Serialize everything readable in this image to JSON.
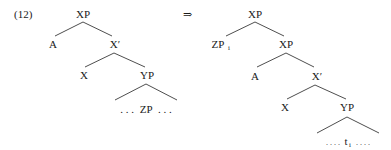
{
  "example_number": "(12)",
  "arrow": "⇒",
  "left_tree": {
    "root": "XP",
    "spec": "A",
    "xbar": "X′",
    "head": "X",
    "complement": "YP",
    "contents": "ZP",
    "ellipsis_left": ". . .",
    "ellipsis_right": ". . .",
    "contents_full": ". . . ZP . . ."
  },
  "right_tree": {
    "root": "XP",
    "moved": "ZP",
    "moved_index": "i",
    "inner_xp": "XP",
    "spec": "A",
    "xbar": "X′",
    "head": "X",
    "complement": "YP",
    "trace": "t",
    "trace_index": "i",
    "ellipsis_left": ". . . .",
    "ellipsis_right": ". . . .",
    "contents_full": ". . . . t_i . . . ."
  },
  "colors": {
    "text": "#1a1a1a",
    "lines": "#3a3a3a",
    "background": "#ffffff"
  }
}
